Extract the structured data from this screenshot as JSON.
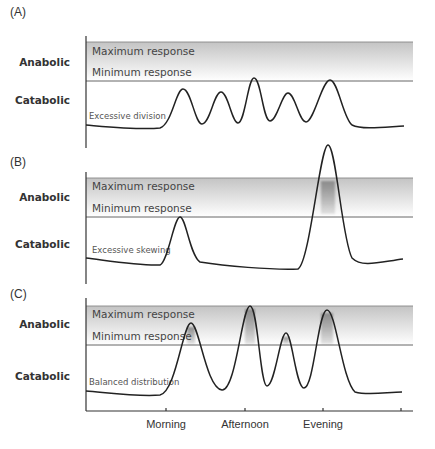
{
  "figure": {
    "panels": [
      {
        "id": "A",
        "letter": "(A)",
        "anabolic_label": "Anabolic",
        "catabolic_label": "Catabolic",
        "max_label": "Maximum response",
        "min_label": "Minimum response",
        "curve_note": "Excessive division",
        "band_top": 42,
        "min_line": 81,
        "axis_top": 36,
        "axis_bottom": 148,
        "curve_path": "M86,125 C110,127 140,130 160,128 C172,124 176,89 183,89 C191,89 195,124 202,124 C210,124 214,92 221,92 C228,92 232,123 238,123 C245,123 248,78 254,78 C261,78 263,121 270,121 C277,121 282,93 288,93 C295,93 299,122 306,122 C314,122 322,80 330,80 C338,80 343,118 352,125 C362,130 385,127 404,126",
        "highlights": []
      },
      {
        "id": "B",
        "letter": "(B)",
        "anabolic_label": "Anabolic",
        "catabolic_label": "Catabolic",
        "max_label": "Maximum response",
        "min_label": "Minimum response",
        "curve_note": "Excessive skewing",
        "band_top": 178,
        "min_line": 217,
        "axis_top": 172,
        "axis_bottom": 284,
        "curve_path": "M86,258 C110,261 140,266 160,265 C168,262 174,217 180,217 C186,217 190,256 200,262 C225,266 270,270 298,269 C310,262 320,145 328,145 C336,145 342,240 352,258 C362,268 380,262 403,259",
        "highlights": [
          {
            "x": 320,
            "top": 181,
            "bottom": 214,
            "width": 16
          }
        ]
      },
      {
        "id": "C",
        "letter": "(C)",
        "anabolic_label": "Anabolic",
        "catabolic_label": "Catabolic",
        "max_label": "Maximum response",
        "min_label": "Minimum response",
        "curve_note": "Balanced distribution",
        "band_top": 306,
        "min_line": 345,
        "axis_top": 298,
        "axis_bottom": 411,
        "curve_path": "M86,391 C110,393 140,397 160,395 C176,392 183,323 191,323 C199,323 206,388 222,390 C236,391 242,306 250,306 C258,306 260,386 267,386 C275,386 280,333 286,333 C292,333 296,388 304,388 C314,388 318,310 327,310 C336,310 342,380 355,392 C368,396 388,392 402,392",
        "highlights": [
          {
            "x": 186,
            "top": 327,
            "bottom": 344,
            "width": 10
          },
          {
            "x": 244,
            "top": 309,
            "bottom": 344,
            "width": 12
          },
          {
            "x": 282,
            "top": 337,
            "bottom": 344,
            "width": 8
          },
          {
            "x": 320,
            "top": 313,
            "bottom": 344,
            "width": 14
          }
        ]
      }
    ],
    "x_axis": {
      "y": 411,
      "x_start": 86,
      "x_end": 413,
      "ticks": [
        {
          "x": 166,
          "label": "Morning"
        },
        {
          "x": 245,
          "label": "Afternoon"
        },
        {
          "x": 323,
          "label": "Evening"
        },
        {
          "x": 401,
          "label": ""
        }
      ]
    },
    "colors": {
      "band_top": "#c4c4c4",
      "band_bottom": "#ffffff",
      "highlight": "#8a8a8a",
      "curve": "#222222"
    }
  }
}
